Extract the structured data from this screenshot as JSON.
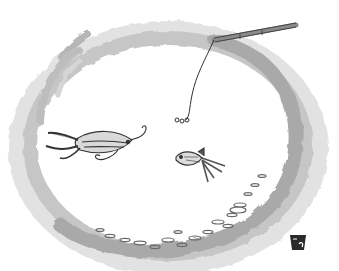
{
  "image": {
    "kind": "cartoon illustration",
    "description": "Fishbowl seen from above with a squid, a goldfish, a fishing line with hook dangling from a rod, and a school of small fish along the bottom rim",
    "signature": "artist monogram",
    "colors": {
      "background": "#ffffff",
      "bowl_wash_dark": "#a8a8a8",
      "bowl_wash_mid": "#c4c4c4",
      "bowl_wash_light": "#dcdcdc",
      "ink": "#333333",
      "creature_fill": "#d8d8d8"
    }
  }
}
